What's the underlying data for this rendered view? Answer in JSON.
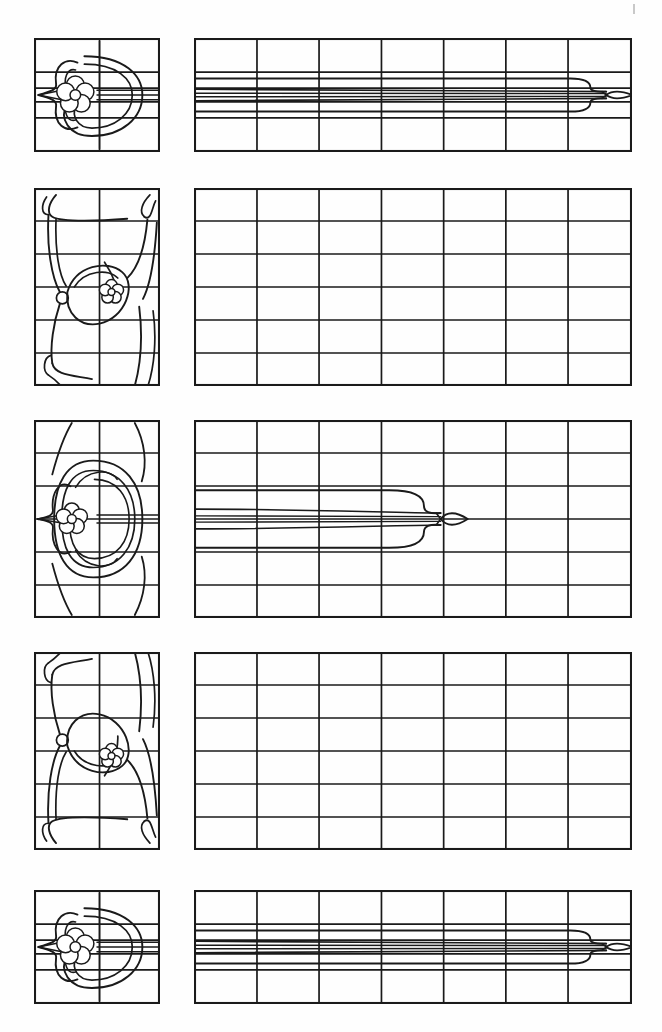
{
  "document": {
    "title": "Art Nouveau Stained Glass Pattern Sheet",
    "kind": "line-art-pattern-plate",
    "page_background": "#fefefe",
    "ink_color": "#1a1a1a",
    "sheet_width": 662,
    "sheet_height": 1032
  },
  "marks": {
    "corner_tick": {
      "label": "registration-tick",
      "x": 633,
      "y": 4,
      "width": 2,
      "height": 10,
      "color": "#c9c9c9"
    }
  },
  "rows": [
    {
      "id": "row-1",
      "label": "Row 1 — Rosette square with long leaf band",
      "y": 38,
      "left": {
        "label": "rosette-square-panel",
        "x": 34,
        "y": 38,
        "width": 126,
        "height": 114,
        "cols": 2,
        "rows": 4,
        "col_fracs": [
          0.52
        ],
        "row_fracs": [
          0.3,
          0.44,
          0.56,
          0.7
        ],
        "motif": "rosette-with-fan-leaf",
        "motif_variant": "wide"
      },
      "right": {
        "label": "long-leaf-band-panel",
        "x": 194,
        "y": 38,
        "width": 438,
        "height": 114,
        "cols": 7,
        "rows": 4,
        "col_fracs": [
          0.1438,
          0.2855,
          0.428,
          0.57,
          0.712,
          0.854
        ],
        "row_fracs": [
          0.3,
          0.44,
          0.56,
          0.7
        ],
        "leaf": {
          "present": true,
          "type": "long-spear-leaf",
          "start_frac": 0.0,
          "bulb_end_frac": 0.905,
          "tip_frac": 1.0,
          "strands": 5
        }
      }
    },
    {
      "id": "row-2",
      "label": "Row 2 — Whiplash scroll upright with empty grid",
      "y": 188,
      "left": {
        "label": "whiplash-upright-panel",
        "x": 34,
        "y": 188,
        "width": 126,
        "height": 198,
        "cols": 2,
        "rows": 6,
        "col_fracs": [
          0.52
        ],
        "row_fracs": [
          0.1667,
          0.3333,
          0.5,
          0.6667,
          0.8333
        ],
        "motif": "whiplash-scroll-upper-flower",
        "motif_variant": "upright"
      },
      "right": {
        "label": "empty-grid-panel",
        "x": 194,
        "y": 188,
        "width": 438,
        "height": 198,
        "cols": 7,
        "rows": 6,
        "col_fracs": [
          0.1438,
          0.2855,
          0.428,
          0.57,
          0.712,
          0.854
        ],
        "row_fracs": [
          0.1667,
          0.3333,
          0.5,
          0.6667,
          0.8333
        ],
        "leaf": {
          "present": false
        }
      }
    },
    {
      "id": "row-3",
      "label": "Row 3 — Full rose square with medium leaf band",
      "y": 420,
      "left": {
        "label": "rose-square-panel",
        "x": 34,
        "y": 420,
        "width": 126,
        "height": 198,
        "cols": 2,
        "rows": 6,
        "col_fracs": [
          0.52
        ],
        "row_fracs": [
          0.1667,
          0.3333,
          0.5,
          0.6667,
          0.8333
        ],
        "motif": "full-rose-with-scrolls",
        "motif_variant": "tall"
      },
      "right": {
        "label": "medium-leaf-band-panel",
        "x": 194,
        "y": 420,
        "width": 438,
        "height": 198,
        "cols": 7,
        "rows": 6,
        "col_fracs": [
          0.1438,
          0.2855,
          0.428,
          0.57,
          0.712,
          0.854
        ],
        "row_fracs": [
          0.1667,
          0.3333,
          0.5,
          0.6667,
          0.8333
        ],
        "leaf": {
          "present": true,
          "type": "short-spear-leaf",
          "start_frac": 0.0,
          "bulb_end_frac": 0.525,
          "tip_frac": 0.625,
          "strands": 5
        }
      }
    },
    {
      "id": "row-4",
      "label": "Row 4 — Mirrored whiplash scroll with empty grid",
      "y": 652,
      "left": {
        "label": "whiplash-mirror-panel",
        "x": 34,
        "y": 652,
        "width": 126,
        "height": 198,
        "cols": 2,
        "rows": 6,
        "col_fracs": [
          0.52
        ],
        "row_fracs": [
          0.1667,
          0.3333,
          0.5,
          0.6667,
          0.8333
        ],
        "motif": "whiplash-scroll-lower-flower",
        "motif_variant": "mirrored"
      },
      "right": {
        "label": "empty-grid-panel",
        "x": 194,
        "y": 652,
        "width": 438,
        "height": 198,
        "cols": 7,
        "rows": 6,
        "col_fracs": [
          0.1438,
          0.2855,
          0.428,
          0.57,
          0.712,
          0.854
        ],
        "row_fracs": [
          0.1667,
          0.3333,
          0.5,
          0.6667,
          0.8333
        ],
        "leaf": {
          "present": false
        }
      }
    },
    {
      "id": "row-5",
      "label": "Row 5 — Rosette square with long leaf band (repeat)",
      "y": 890,
      "left": {
        "label": "rosette-square-panel",
        "x": 34,
        "y": 890,
        "width": 126,
        "height": 114,
        "cols": 2,
        "rows": 4,
        "col_fracs": [
          0.52
        ],
        "row_fracs": [
          0.3,
          0.44,
          0.56,
          0.7
        ],
        "motif": "rosette-with-fan-leaf",
        "motif_variant": "wide"
      },
      "right": {
        "label": "long-leaf-band-panel",
        "x": 194,
        "y": 890,
        "width": 438,
        "height": 114,
        "cols": 7,
        "rows": 4,
        "col_fracs": [
          0.1438,
          0.2855,
          0.428,
          0.57,
          0.712,
          0.854
        ],
        "row_fracs": [
          0.3,
          0.44,
          0.56,
          0.7
        ],
        "leaf": {
          "present": true,
          "type": "long-spear-leaf",
          "start_frac": 0.0,
          "bulb_end_frac": 0.905,
          "tip_frac": 1.0,
          "strands": 5
        }
      }
    }
  ]
}
